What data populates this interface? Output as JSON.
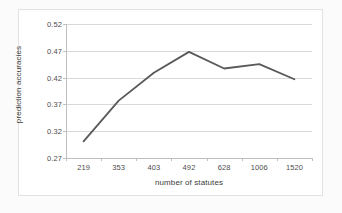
{
  "chart_data": {
    "type": "line",
    "title": "",
    "xlabel": "number of statutes",
    "ylabel": "prediction accuracies",
    "categories": [
      "219",
      "353",
      "403",
      "492",
      "628",
      "1006",
      "1520"
    ],
    "values": [
      0.301,
      0.377,
      0.429,
      0.468,
      0.437,
      0.445,
      0.417
    ],
    "series": [
      {
        "name": "prediction accuracies",
        "values": [
          0.301,
          0.377,
          0.429,
          0.468,
          0.437,
          0.445,
          0.417
        ]
      }
    ],
    "ylim": [
      0.27,
      0.52
    ],
    "yticks": [
      "0.27",
      "0.32",
      "0.37",
      "0.42",
      "0.47",
      "0.52"
    ],
    "ytick_values": [
      0.27,
      0.32,
      0.37,
      0.42,
      0.47,
      0.52
    ],
    "xticks": [
      "219",
      "353",
      "403",
      "492",
      "628",
      "1006",
      "1520"
    ],
    "grid": "horizontal",
    "legend": "none",
    "line_color": "#595959",
    "gridline_color": "#d9d9d9",
    "axis_color": "#bfbfbf",
    "plot_background": "#ffffff",
    "figure_background": "#fbfbfb"
  }
}
